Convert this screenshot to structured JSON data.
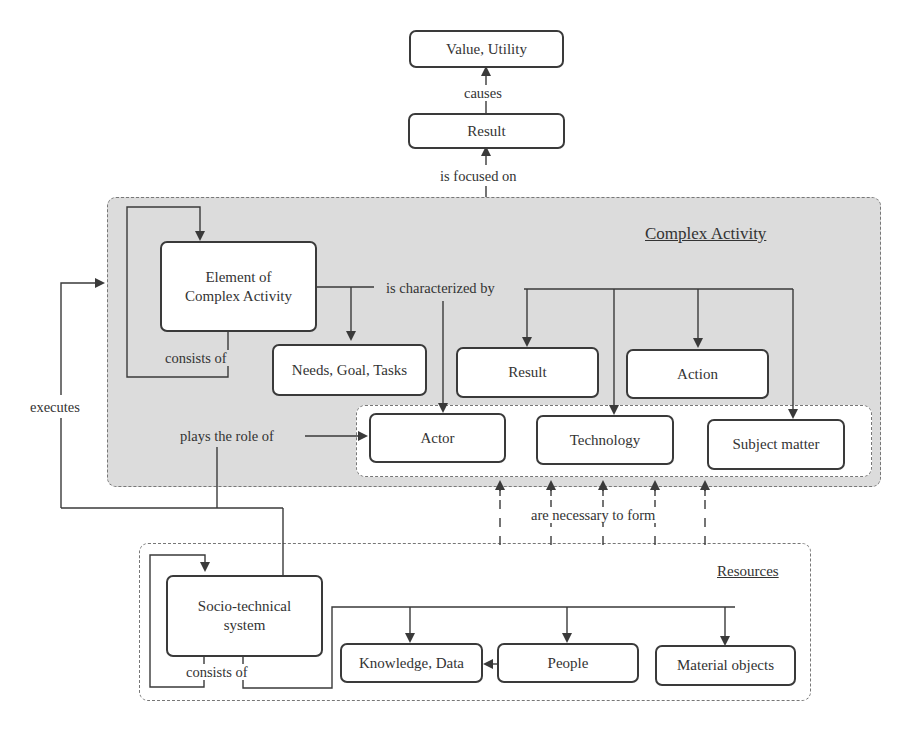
{
  "diagram": {
    "containers": {
      "complex_activity": {
        "title": "Complex Activity"
      },
      "resources": {
        "title": "Resources"
      }
    },
    "nodes": {
      "value_utility": "Value, Utility",
      "result_top": "Result",
      "element_line1": "Element of",
      "element_line2": "Complex Activity",
      "needs_goal_tasks": "Needs, Goal, Tasks",
      "result": "Result",
      "action": "Action",
      "actor": "Actor",
      "technology": "Technology",
      "subject_matter": "Subject matter",
      "socio_line1": "Socio-technical",
      "socio_line2": "system",
      "knowledge_data": "Knowledge, Data",
      "people": "People",
      "material_objects": "Material objects"
    },
    "edge_labels": {
      "causes": "causes",
      "is_focused_on": "is focused on",
      "is_characterized_by": "is characterized by",
      "consists_of_top": "consists of",
      "executes": "executes",
      "plays_the_role_of": "plays the role of",
      "are_necessary_to_form": "are necessary to form",
      "consists_of_bottom": "consists of"
    },
    "colors": {
      "complex_activity_fill": "#dcdcdc",
      "stroke": "#3a3a3a",
      "background": "#ffffff"
    }
  }
}
